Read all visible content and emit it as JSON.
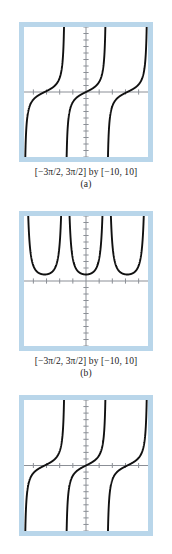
{
  "figure": {
    "panels": [
      {
        "id": "a",
        "letter": "(a)",
        "caption": "[−3π/2, 3π/2] by [−10, 10]",
        "function_label": "y = tan x"
      },
      {
        "id": "b",
        "letter": "(b)",
        "caption": "[−3π/2, 3π/2] by [−10, 10]",
        "function_label": "y = sec² x"
      },
      {
        "id": "c",
        "letter": "",
        "caption": "",
        "function_label": "y = tan x"
      }
    ]
  },
  "colors": {
    "frame_border": "#b9d6ea",
    "screen_background": "#ffffff",
    "axis": "#8b8f96",
    "curve": "#111111",
    "caption_text": "#1b1b1b"
  },
  "chart_data": [
    {
      "type": "line",
      "title": "",
      "subtitle": "(a)",
      "function": "y = tan x",
      "xlabel": "",
      "ylabel": "",
      "xlim": [
        -4.71238898038469,
        4.71238898038469
      ],
      "ylim": [
        -10,
        10
      ],
      "xtick_step": 1,
      "ytick_step": 1,
      "grid": false,
      "legend": null,
      "asymptotes": [
        -3.141592653589793,
        0,
        3.141592653589793
      ],
      "branches": [
        {
          "x_range": [
            -4.71238898038469,
            -1.570796326794897
          ],
          "note": "branch centered at x = -π"
        },
        {
          "x_range": [
            -1.570796326794897,
            1.570796326794897
          ],
          "note": "principal branch centered at x = 0"
        },
        {
          "x_range": [
            1.570796326794897,
            4.71238898038469
          ],
          "note": "branch centered at x = π"
        }
      ],
      "sample_points": [
        {
          "x": -4.3,
          "y": -2.29
        },
        {
          "x": -4.0,
          "y": -1.16
        },
        {
          "x": -3.5,
          "y": -0.37
        },
        {
          "x": -3.14159,
          "y": 0.0
        },
        {
          "x": -2.8,
          "y": 0.36
        },
        {
          "x": -2.3,
          "y": 1.12
        },
        {
          "x": -1.9,
          "y": 2.93
        },
        {
          "x": -1.2,
          "y": -2.57
        },
        {
          "x": -0.8,
          "y": -1.03
        },
        {
          "x": 0.0,
          "y": 0.0
        },
        {
          "x": 0.8,
          "y": 1.03
        },
        {
          "x": 1.2,
          "y": 2.57
        },
        {
          "x": 1.9,
          "y": -2.93
        },
        {
          "x": 2.3,
          "y": -1.12
        },
        {
          "x": 3.14159,
          "y": 0.0
        },
        {
          "x": 3.5,
          "y": 0.37
        },
        {
          "x": 4.0,
          "y": 1.16
        },
        {
          "x": 4.3,
          "y": 2.29
        }
      ]
    },
    {
      "type": "line",
      "title": "",
      "subtitle": "(b)",
      "function": "y = sec² x",
      "xlabel": "",
      "ylabel": "",
      "xlim": [
        -4.71238898038469,
        4.71238898038469
      ],
      "ylim": [
        -10,
        10
      ],
      "xtick_step": 1,
      "ytick_step": 1,
      "grid": false,
      "legend": null,
      "asymptotes": [
        -3.141592653589793,
        0,
        3.141592653589793
      ],
      "minima": [
        {
          "x": -3.141592653589793,
          "y": 1
        },
        {
          "x": 0,
          "y": 1
        },
        {
          "x": 3.141592653589793,
          "y": 1
        }
      ],
      "sample_points": [
        {
          "x": -4.3,
          "y": 6.26
        },
        {
          "x": -4.0,
          "y": 2.34
        },
        {
          "x": -3.6,
          "y": 1.25
        },
        {
          "x": -3.14159,
          "y": 1.0
        },
        {
          "x": -2.7,
          "y": 1.2
        },
        {
          "x": -2.3,
          "y": 2.26
        },
        {
          "x": -1.9,
          "y": 9.58
        },
        {
          "x": -1.2,
          "y": 7.6
        },
        {
          "x": -0.8,
          "y": 2.06
        },
        {
          "x": -0.4,
          "y": 1.18
        },
        {
          "x": 0.0,
          "y": 1.0
        },
        {
          "x": 0.4,
          "y": 1.18
        },
        {
          "x": 0.8,
          "y": 2.06
        },
        {
          "x": 1.2,
          "y": 7.6
        },
        {
          "x": 1.9,
          "y": 9.58
        },
        {
          "x": 2.3,
          "y": 2.26
        },
        {
          "x": 3.14159,
          "y": 1.0
        },
        {
          "x": 4.0,
          "y": 2.34
        },
        {
          "x": 4.3,
          "y": 6.26
        }
      ]
    },
    {
      "type": "line",
      "title": "",
      "subtitle": "",
      "function": "y = tan x",
      "xlabel": "",
      "ylabel": "",
      "xlim": [
        -4.71238898038469,
        4.71238898038469
      ],
      "ylim": [
        -10,
        10
      ],
      "xtick_step": 1,
      "ytick_step": 1,
      "grid": false,
      "legend": null,
      "asymptotes": [
        -3.141592653589793,
        0,
        3.141592653589793
      ],
      "sample_points": [
        {
          "x": -4.3,
          "y": -2.29
        },
        {
          "x": -4.0,
          "y": -1.16
        },
        {
          "x": -3.5,
          "y": -0.37
        },
        {
          "x": -3.14159,
          "y": 0.0
        },
        {
          "x": -2.8,
          "y": 0.36
        },
        {
          "x": -2.3,
          "y": 1.12
        },
        {
          "x": -1.9,
          "y": 2.93
        },
        {
          "x": -1.2,
          "y": -2.57
        },
        {
          "x": -0.8,
          "y": -1.03
        },
        {
          "x": 0.0,
          "y": 0.0
        },
        {
          "x": 0.8,
          "y": 1.03
        },
        {
          "x": 1.2,
          "y": 2.57
        },
        {
          "x": 1.9,
          "y": -2.93
        },
        {
          "x": 2.3,
          "y": -1.12
        },
        {
          "x": 3.14159,
          "y": 0.0
        },
        {
          "x": 3.5,
          "y": 0.37
        },
        {
          "x": 4.0,
          "y": 1.16
        },
        {
          "x": 4.3,
          "y": 2.29
        }
      ]
    }
  ]
}
